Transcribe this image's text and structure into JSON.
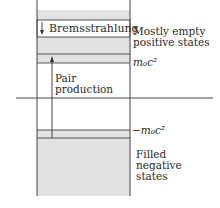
{
  "diagram": {
    "colors": {
      "band_fill": "#e2e2e2",
      "line": "#444444",
      "background": "#ffffff"
    },
    "labels": {
      "bremsstrahlung": "Bremsstrahlung",
      "positive_states": [
        "Mostly empty",
        "positive states"
      ],
      "pair_production": [
        "Pair",
        "production"
      ],
      "positive_energy_edge": "m₀c²",
      "negative_energy_edge": "−m₀c²",
      "negative_states": [
        "Filled",
        "negative",
        "states"
      ]
    }
  }
}
